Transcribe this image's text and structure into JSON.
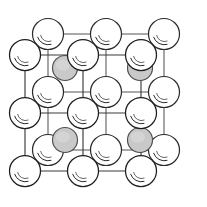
{
  "figure": {
    "width": 207,
    "height": 207,
    "background_color": "#ffffff"
  },
  "style": {
    "edge_color": "#3a3a3a",
    "edge_color_back": "#555555",
    "corner_atom_fill": "#ffffff",
    "corner_atom_stroke": "#1e1e1e",
    "corner_atom_shine_color": "#2b2b2b",
    "face_atom_fill": "#c9c9c9",
    "face_atom_stroke": "#4d4d4d",
    "edge_width": 1.15,
    "corner_atom_radius": 15.5,
    "face_atom_radius": 12.5
  },
  "geometry": {
    "depth_offset_x": 23,
    "depth_offset_y": -21,
    "front_origin_x": 25,
    "front_origin_y": 55,
    "cell_step_x": 58,
    "cell_step_y": 58,
    "grid_columns": 3,
    "grid_rows": 3
  },
  "lattice": {
    "type": "face-centered-cubic",
    "corner_atom_count": 18,
    "face_atom_count": 4,
    "cells_across": 2,
    "cells_down": 2,
    "corner_atoms": [
      {
        "id": "front-0-0",
        "label": "corner atom front row 1 col 1",
        "cx": 25,
        "cy": 55,
        "layer": "front"
      },
      {
        "id": "front-0-1",
        "label": "corner atom front row 1 col 2",
        "cx": 83,
        "cy": 55,
        "layer": "front"
      },
      {
        "id": "front-0-2",
        "label": "corner atom front row 1 col 3",
        "cx": 141,
        "cy": 55,
        "layer": "front"
      },
      {
        "id": "front-1-0",
        "label": "corner atom front row 2 col 1",
        "cx": 25,
        "cy": 113,
        "layer": "front"
      },
      {
        "id": "front-1-1",
        "label": "corner atom front row 2 col 2",
        "cx": 83,
        "cy": 113,
        "layer": "front"
      },
      {
        "id": "front-1-2",
        "label": "corner atom front row 2 col 3",
        "cx": 141,
        "cy": 113,
        "layer": "front"
      },
      {
        "id": "front-2-0",
        "label": "corner atom front row 3 col 1",
        "cx": 25,
        "cy": 171,
        "layer": "front"
      },
      {
        "id": "front-2-1",
        "label": "corner atom front row 3 col 2",
        "cx": 83,
        "cy": 171,
        "layer": "front"
      },
      {
        "id": "front-2-2",
        "label": "corner atom front row 3 col 3",
        "cx": 141,
        "cy": 171,
        "layer": "front"
      },
      {
        "id": "back-0-0",
        "label": "corner atom back row 1 col 1",
        "cx": 48,
        "cy": 34,
        "layer": "back"
      },
      {
        "id": "back-0-1",
        "label": "corner atom back row 1 col 2",
        "cx": 106,
        "cy": 34,
        "layer": "back"
      },
      {
        "id": "back-0-2",
        "label": "corner atom back row 1 col 3",
        "cx": 164,
        "cy": 34,
        "layer": "back"
      },
      {
        "id": "back-1-0",
        "label": "corner atom back row 2 col 1",
        "cx": 48,
        "cy": 92,
        "layer": "back"
      },
      {
        "id": "back-1-1",
        "label": "corner atom back row 2 col 2",
        "cx": 106,
        "cy": 92,
        "layer": "back"
      },
      {
        "id": "back-1-2",
        "label": "corner atom back row 2 col 3",
        "cx": 164,
        "cy": 92,
        "layer": "back"
      },
      {
        "id": "back-2-0",
        "label": "corner atom back row 3 col 1",
        "cx": 48,
        "cy": 150,
        "layer": "back"
      },
      {
        "id": "back-2-1",
        "label": "corner atom back row 3 col 2",
        "cx": 106,
        "cy": 150,
        "layer": "back"
      },
      {
        "id": "back-2-2",
        "label": "corner atom back row 3 col 3",
        "cx": 164,
        "cy": 150,
        "layer": "back"
      }
    ],
    "face_atoms": [
      {
        "id": "face-top-left",
        "label": "face centre atom top left cell",
        "cx": 65,
        "cy": 68,
        "r": 12.5
      },
      {
        "id": "face-top-right",
        "label": "face centre atom top right cell",
        "cx": 140,
        "cy": 68,
        "r": 12.5
      },
      {
        "id": "face-bottom-left",
        "label": "face centre atom bottom left cell",
        "cx": 65,
        "cy": 140,
        "r": 12.5
      },
      {
        "id": "face-bottom-right",
        "label": "face centre atom bottom right cell",
        "cx": 140,
        "cy": 140,
        "r": 12.5
      }
    ]
  }
}
